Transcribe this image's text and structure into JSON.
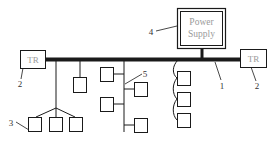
{
  "diagram": {
    "power_supply": {
      "line1": "Power",
      "line2": "Supply"
    },
    "terminator_left": {
      "label": "TR"
    },
    "terminator_right": {
      "label": "TR"
    },
    "callouts": {
      "bus": "1",
      "terminator_left": "2",
      "terminator_right": "2",
      "star_nodes": "3",
      "power_supply": "4",
      "tree_branch": "5"
    },
    "colors": {
      "line": "#1a1a1a",
      "box_text": "#9a9a9a",
      "callout_text": "#333333"
    }
  }
}
